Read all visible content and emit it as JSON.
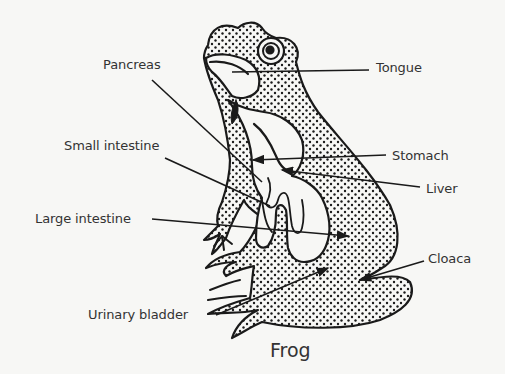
{
  "figure": {
    "caption": "Frog"
  },
  "labels": [
    {
      "id": "pancreas",
      "text": "Pancreas",
      "x": 103,
      "y": 57
    },
    {
      "id": "tongue",
      "text": "Tongue",
      "x": 376,
      "y": 60
    },
    {
      "id": "small-intestine",
      "text": "Small intestine",
      "x": 64,
      "y": 138
    },
    {
      "id": "stomach",
      "text": "Stomach",
      "x": 392,
      "y": 148
    },
    {
      "id": "liver",
      "text": "Liver",
      "x": 426,
      "y": 181
    },
    {
      "id": "large-intestine",
      "text": "Large intestine",
      "x": 35,
      "y": 211
    },
    {
      "id": "cloaca",
      "text": "Cloaca",
      "x": 428,
      "y": 251
    },
    {
      "id": "urinary-bladder",
      "text": "Urinary bladder",
      "x": 88,
      "y": 307
    }
  ],
  "colors": {
    "background": "#f7f7f5",
    "ink": "#1a1a1a",
    "text": "#333333"
  }
}
